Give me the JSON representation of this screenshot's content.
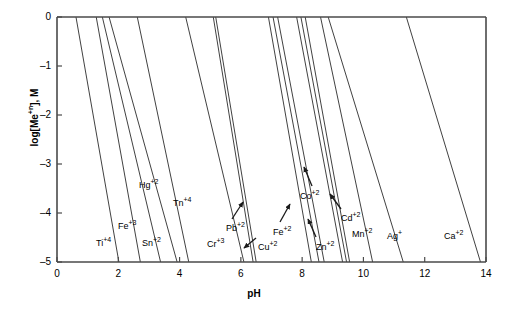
{
  "chart_data": {
    "type": "line",
    "title": "",
    "xlabel": "pH",
    "ylabel": "log[Me+n], M",
    "ylabel_base": "log[Me",
    "ylabel_sup": "+n",
    "ylabel_tail": "], M",
    "xlim": [
      0,
      14
    ],
    "ylim": [
      -5,
      0
    ],
    "xticks": [
      0,
      2,
      4,
      6,
      8,
      10,
      12,
      14
    ],
    "xticklabels": [
      "0",
      "2",
      "4",
      "6",
      "8",
      "10",
      "12",
      "14"
    ],
    "yticks": [
      0,
      -1,
      -2,
      -3,
      -4,
      -5
    ],
    "yticklabels": [
      "0",
      "–1",
      "–2",
      "–3",
      "–4",
      "–5"
    ],
    "grid": false,
    "legend": "inline-annotations",
    "line_color": "#2b2b2b",
    "axis_color": "#555555",
    "series": [
      {
        "name": "Ti+2",
        "label_base": "Ti",
        "label_sup": "+4",
        "x_top": 0.62,
        "x_bottom": 2.02,
        "label_x": 96,
        "label_y": 239
      },
      {
        "name": "Fe+3",
        "label_base": "Fe",
        "label_sup": "+3",
        "x_top": 1.28,
        "x_bottom": 2.72,
        "label_x": 118,
        "label_y": 222
      },
      {
        "name": "Sn+2",
        "label_base": "Sn",
        "label_sup": "+2",
        "x_top": 1.48,
        "x_bottom": 3.38,
        "label_x": 142,
        "label_y": 239
      },
      {
        "name": "Hg+2",
        "label_base": "Hg",
        "label_sup": "+2",
        "x_top": 1.7,
        "x_bottom": 3.92,
        "label_x": 139,
        "label_y": 181
      },
      {
        "name": "Tn+4",
        "label_base": "Tn",
        "label_sup": "+4",
        "x_top": 2.62,
        "x_bottom": 4.3,
        "label_x": 173,
        "label_y": 199
      },
      {
        "name": "Cr+3",
        "label_base": "Cr",
        "label_sup": "+3",
        "x_top": 4.2,
        "x_bottom": 6.1,
        "label_x": 207,
        "label_y": 240
      },
      {
        "name": "Pb+2",
        "label_base": "Pb",
        "label_sup": "+2",
        "x_top": 5.1,
        "x_bottom": 6.4,
        "label_x": 226,
        "label_y": 224
      },
      {
        "name": "Cu+2",
        "label_base": "Cu",
        "label_sup": "+2",
        "x_top": 5.18,
        "x_bottom": 6.5,
        "label_x": 258,
        "label_y": 243
      },
      {
        "name": "Fe+2",
        "label_base": "Fe",
        "label_sup": "+2",
        "x_top": 6.9,
        "x_bottom": 8.3,
        "label_x": 273,
        "label_y": 228
      },
      {
        "name": "Zn+2",
        "label_base": "Zn",
        "label_sup": "+2",
        "x_top": 7.05,
        "x_bottom": 8.55,
        "label_x": 316,
        "label_y": 243
      },
      {
        "name": "Co+2",
        "label_base": "Co",
        "label_sup": "+2",
        "x_top": 7.2,
        "x_bottom": 8.72,
        "label_x": 300,
        "label_y": 192
      },
      {
        "name": "Cd+2",
        "label_base": "Cd",
        "label_sup": "+2",
        "x_top": 7.82,
        "x_bottom": 9.32,
        "label_x": 341,
        "label_y": 214
      },
      {
        "name": "Mn+2",
        "label_base": "Mn",
        "label_sup": "+2",
        "x_top": 7.96,
        "x_bottom": 9.45,
        "label_x": 352,
        "label_y": 230
      },
      {
        "name": "Ag+",
        "label_base": "Ag",
        "label_sup": "+",
        "x_top": 8.6,
        "x_bottom": 10.3,
        "label_x": 387,
        "label_y": 232
      },
      {
        "name": "Ca+2",
        "label_base": "Ca",
        "label_sup": "+2",
        "x_top": 11.4,
        "x_bottom": 13.82,
        "label_x": 444,
        "label_y": 232
      }
    ],
    "extra_lines": [
      {
        "name": "unlabeled-ag-pair",
        "x_top": 8.85,
        "x_bottom": 11.3
      },
      {
        "name": "unlabeled-mn-pair",
        "x_top": 8.1,
        "x_bottom": 9.55
      }
    ],
    "annotation_arrows": [
      {
        "for": "Pb+2",
        "x1": 232,
        "y1": 219,
        "x2": 243,
        "y2": 202
      },
      {
        "for": "Cu+2",
        "x1": 256,
        "y1": 238,
        "x2": 244,
        "y2": 248
      },
      {
        "for": "Fe+2",
        "x1": 280,
        "y1": 222,
        "x2": 290,
        "y2": 204
      },
      {
        "for": "Co+2",
        "x1": 312,
        "y1": 186,
        "x2": 304,
        "y2": 167
      },
      {
        "for": "Zn+2",
        "x1": 316,
        "y1": 237,
        "x2": 308,
        "y2": 219
      },
      {
        "for": "Cd+2",
        "x1": 341,
        "y1": 209,
        "x2": 330,
        "y2": 194
      }
    ]
  }
}
